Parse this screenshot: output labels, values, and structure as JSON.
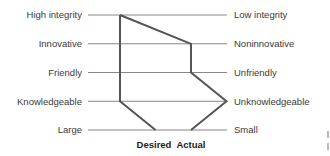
{
  "chart_data": {
    "type": "line",
    "title": "",
    "scale_points": 5,
    "rows": [
      {
        "left": "High integrity",
        "right": "Low integrity"
      },
      {
        "left": "Innovative",
        "right": "Noninnovative"
      },
      {
        "left": "Friendly",
        "right": "Unfriendly"
      },
      {
        "left": "Knowledgeable",
        "right": "Unknowledgeable"
      },
      {
        "left": "Large",
        "right": "Small"
      }
    ],
    "series": [
      {
        "name": "Desired",
        "values": [
          1,
          1,
          1,
          1,
          2
        ],
        "color": "#555555"
      },
      {
        "name": "Actual",
        "values": [
          1,
          3,
          3,
          4,
          3
        ],
        "color": "#555555"
      }
    ],
    "legend": [
      "Desired",
      "Actual"
    ],
    "legend_position": "bottom",
    "grid": true
  }
}
